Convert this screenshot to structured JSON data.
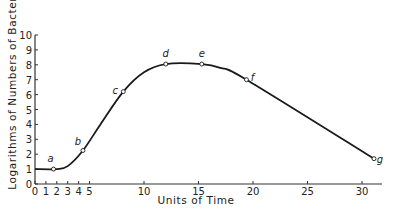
{
  "chart_data": {
    "type": "line",
    "title": "",
    "xlabel": "Units of Time",
    "ylabel": "Logarithms of Numbers of Bacteria",
    "xlim": [
      0,
      32
    ],
    "ylim": [
      0,
      10
    ],
    "x_ticks": [
      0,
      1,
      2,
      3,
      4,
      5,
      10,
      15,
      20,
      25,
      30
    ],
    "y_ticks": [
      0,
      1,
      2,
      3,
      4,
      5,
      6,
      7,
      8,
      9,
      10
    ],
    "grid": false,
    "legend": null,
    "series": [
      {
        "name": "Bacterial growth curve",
        "points": [
          {
            "x": 0,
            "y": 1.0
          },
          {
            "x": 2,
            "y": 1.0
          },
          {
            "x": 3,
            "y": 1.2
          },
          {
            "x": 4.4,
            "y": 2.25
          },
          {
            "x": 6,
            "y": 4.0
          },
          {
            "x": 8.1,
            "y": 6.2
          },
          {
            "x": 10,
            "y": 7.5
          },
          {
            "x": 12,
            "y": 8.05
          },
          {
            "x": 15.3,
            "y": 8.05
          },
          {
            "x": 17,
            "y": 7.8
          },
          {
            "x": 19.4,
            "y": 7.0
          },
          {
            "x": 31.1,
            "y": 1.7
          }
        ]
      }
    ],
    "annotations": [
      {
        "label": "a",
        "x": 1.7,
        "y": 1.0
      },
      {
        "label": "b",
        "x": 4.4,
        "y": 2.25
      },
      {
        "label": "c",
        "x": 8.1,
        "y": 6.2
      },
      {
        "label": "d",
        "x": 12.0,
        "y": 8.05
      },
      {
        "label": "e",
        "x": 15.3,
        "y": 8.05
      },
      {
        "label": "f",
        "x": 19.4,
        "y": 7.0
      },
      {
        "label": "g",
        "x": 31.1,
        "y": 1.7
      }
    ]
  },
  "colors": {
    "line": "#1a1a1a",
    "axis": "#333333",
    "background": "#ffffff"
  }
}
